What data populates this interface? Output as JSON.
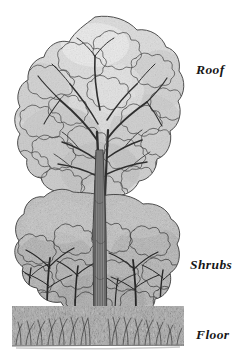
{
  "figure": {
    "background_color": "#ffffff",
    "ink_color": "#1a1a1a",
    "foliage_light": "#d8d8d8",
    "foliage_mid": "#b4b4b4",
    "foliage_dark": "#8c8c8c",
    "trunk_color": "#6e6e6e",
    "ground_line_color": "#8a8a8a"
  },
  "labels": {
    "roof": "Roof",
    "shrubs": "Shrubs",
    "floor": "Floor"
  },
  "layers": [
    {
      "name": "roof",
      "label": "Roof",
      "top": 18,
      "bottom": 198
    },
    {
      "name": "shrubs",
      "label": "Shrubs",
      "top": 198,
      "bottom": 305
    },
    {
      "name": "floor",
      "label": "Floor",
      "top": 305,
      "bottom": 347
    }
  ]
}
